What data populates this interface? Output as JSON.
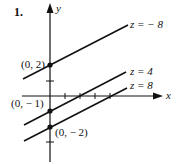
{
  "problem_number": "1.",
  "axes": {
    "x_label": "x",
    "y_label": "y"
  },
  "points": [
    {
      "label": "(0, 2)",
      "x": 0,
      "y": 2
    },
    {
      "label": "(0, − 1)",
      "x": 0,
      "y": -1
    },
    {
      "label": "(0, − 2)",
      "x": 0,
      "y": -2
    }
  ],
  "lines": [
    {
      "label": "z  =  − 8",
      "z": -8,
      "y_intercept": 2
    },
    {
      "label": "z  =  4",
      "z": 4,
      "y_intercept": -1
    },
    {
      "label": "z  =  8",
      "z": 8,
      "y_intercept": -2
    }
  ],
  "colors": {
    "ink": "#111111",
    "background": "#ffffff"
  }
}
